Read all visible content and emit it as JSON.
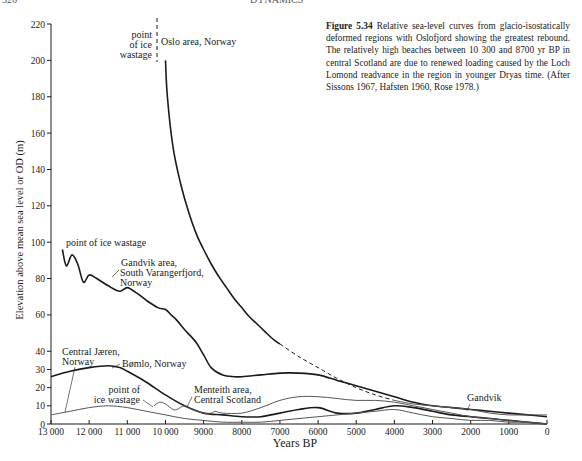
{
  "page": {
    "page_number": "326",
    "running_head": "DYNAMICS"
  },
  "caption": {
    "label": "Figure 5.34",
    "text": "Relative sea-level curves from glacio-isostatically deformed regions with Oslofjord showing the greatest rebound. The relatively high beaches between 10 300 and 8700 yr BP in central Scotland are due to renewed loading caused by the Loch Lomond readvance in the region in younger Dryas time. (After Sissons 1967, Hafsten 1960, Rose 1978.)"
  },
  "chart_data": {
    "type": "line",
    "title": "Relative sea-level curves from glacio-isostatically deformed regions",
    "xlabel": "Years BP",
    "ylabel": "Elevation above mean sea level or OD (m)",
    "xlim": [
      13000,
      0
    ],
    "ylim": [
      0,
      220
    ],
    "grid": false,
    "legend": "none (direct labels)",
    "x_ticks": [
      13000,
      12000,
      11000,
      10000,
      9000,
      8000,
      7000,
      6000,
      5000,
      4000,
      3000,
      2000,
      1000,
      0
    ],
    "x_tick_labels": [
      "13 000",
      "12 000",
      "11 000",
      "10 000",
      "9000",
      "8000",
      "7000",
      "6000",
      "5000",
      "4000",
      "3000",
      "2000",
      "1000",
      "0"
    ],
    "y_ticks": [
      0,
      10,
      20,
      30,
      40,
      60,
      80,
      100,
      120,
      140,
      160,
      180,
      200,
      220
    ],
    "y_tick_labels": [
      "0",
      "10",
      "20",
      "30",
      "40",
      "60",
      "80",
      "100",
      "120",
      "140",
      "160",
      "180",
      "200",
      "220"
    ],
    "series": [
      {
        "name": "Oslo area, Norway",
        "style": "solid-heavy",
        "x": [
          10000,
          9950,
          9800,
          9600,
          9400,
          9200,
          9000,
          8800,
          8600,
          8400,
          8200,
          8000,
          7800,
          7600,
          7400,
          7200,
          7000
        ],
        "y": [
          200,
          180,
          152,
          132,
          117,
          105,
          96,
          88,
          81,
          75,
          69,
          64,
          59,
          55,
          51,
          47,
          44
        ]
      },
      {
        "name": "Oslo area (extrapolated)",
        "style": "dashed",
        "x": [
          7000,
          6500,
          6000,
          5500,
          5000,
          4500,
          4000
        ],
        "y": [
          44,
          37,
          31,
          25,
          20,
          16,
          13
        ]
      },
      {
        "name": "Gandvik area, South Varangerfjord, Norway",
        "style": "solid-heavy",
        "x": [
          12700,
          12600,
          12450,
          12300,
          12150,
          12000,
          11800,
          11500,
          11200,
          11000,
          10750,
          10500,
          10200,
          10000,
          9850,
          9700,
          9500,
          9200,
          9000,
          8800,
          8500,
          8200,
          8000,
          7500,
          7000,
          6500,
          6000,
          5500,
          5000,
          4500,
          4000,
          3500,
          3000,
          2500,
          2000,
          1500,
          1000,
          500,
          0
        ],
        "y": [
          96,
          87,
          93,
          88,
          78,
          82,
          80,
          76,
          73,
          75,
          72,
          68,
          64,
          63,
          60,
          57,
          52,
          45,
          38,
          31,
          27,
          26,
          26,
          27,
          28,
          28,
          27,
          24,
          21,
          18,
          15,
          12,
          10,
          9,
          8,
          7,
          6,
          5,
          4
        ]
      },
      {
        "name": "Bømlo, Norway",
        "style": "solid-heavy",
        "x": [
          13000,
          12500,
          12000,
          11500,
          11200,
          11000,
          10500,
          10000,
          9500,
          9000,
          8500,
          8000,
          7500,
          7000,
          6500,
          6000,
          5500,
          5000,
          4500,
          4000,
          3500,
          3000,
          2500,
          2000,
          1500,
          1000,
          500,
          0
        ],
        "y": [
          26,
          29,
          31,
          32,
          31,
          29,
          23,
          16,
          10,
          6,
          5,
          4,
          4,
          6,
          8,
          9,
          6,
          6,
          8,
          10,
          9,
          7,
          5,
          4,
          3,
          2,
          1,
          0
        ]
      },
      {
        "name": "Central Jæren, Norway",
        "style": "solid-thin",
        "x": [
          13000,
          12500,
          12000,
          11500,
          11000,
          10500,
          10000,
          9500,
          9000,
          8500,
          8000,
          7500,
          7000,
          6500,
          6000,
          5500,
          5000,
          4500,
          4000,
          3500,
          3000,
          2500,
          2000,
          1500,
          1000,
          500,
          0
        ],
        "y": [
          5,
          7,
          9,
          10,
          9,
          7,
          5,
          3,
          2,
          1,
          1,
          1,
          2,
          3,
          4,
          5,
          6,
          7,
          8,
          6,
          4,
          3,
          2,
          2,
          1,
          1,
          0
        ]
      },
      {
        "name": "Menteith area, Central Scotland",
        "style": "solid-thin",
        "x": [
          10300,
          10150,
          10000,
          9800,
          9700,
          9500,
          9300,
          9000,
          8800,
          8700,
          8500,
          8000,
          7500,
          7000,
          6500,
          6000,
          5500,
          5000,
          4500,
          4000,
          3500,
          3000,
          2500,
          2000,
          1500,
          1000,
          500,
          0
        ],
        "y": [
          10,
          12,
          11,
          8,
          8,
          10,
          8,
          6,
          6,
          7,
          6,
          6,
          9,
          13,
          15,
          15,
          14,
          13,
          13,
          12,
          10,
          8,
          6,
          4,
          3,
          2,
          1,
          0
        ]
      },
      {
        "name": "Gandvik (late Holocene)",
        "style": "solid-thin",
        "x": [
          4000,
          3500,
          3000,
          2500,
          2000,
          1500,
          1000,
          500,
          0
        ],
        "y": [
          13,
          11,
          10,
          9,
          8,
          6,
          5,
          5,
          5
        ]
      }
    ],
    "annotations": [
      {
        "text": "point of ice wastage",
        "target": "Oslo area, Norway",
        "x": 10000,
        "y": 220,
        "note": "vertical dashed line"
      },
      {
        "text": "Oslo area, Norway"
      },
      {
        "text": "point of ice wastage",
        "target": "Gandvik area",
        "x": 12700,
        "y": 96
      },
      {
        "text": "Gandvik area, South Varangerfjord, Norway"
      },
      {
        "text": "Central Jæren, Norway"
      },
      {
        "text": "Bømlo, Norway"
      },
      {
        "text": "point of ice wastage",
        "target": "Menteith area",
        "x": 10300,
        "y": 10
      },
      {
        "text": "Menteith area, Central Scotland"
      },
      {
        "text": "Gandvik"
      }
    ]
  },
  "labels": {
    "oslo_wastage": [
      "point",
      "of ice",
      "wastage"
    ],
    "oslo": "Oslo area, Norway",
    "gandvik_wastage": "point of ice wastage",
    "gandvik": [
      "Gandvik area,",
      "South Varangerfjord,",
      "Norway"
    ],
    "jaeren": [
      "Central Jæren,",
      "Norway"
    ],
    "bomlo": "Bømlo, Norway",
    "menteith_wastage": [
      "point of",
      "ice wastage"
    ],
    "menteith": [
      "Menteith area,",
      "Central Scotland"
    ],
    "gandvik_short": "Gandvik"
  },
  "colors": {
    "ink": "#1a1a1a",
    "thin_line": "#555555",
    "background": "#ffffff"
  }
}
